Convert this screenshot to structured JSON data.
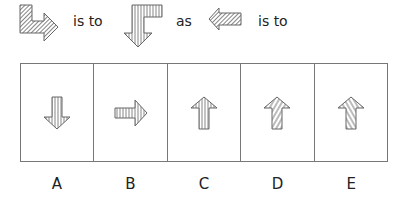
{
  "question": {
    "figure1": {
      "icon": "l-shaped-arrow-right-icon",
      "hatch": "diagonal-dense",
      "color": "#888888"
    },
    "text1": "is to",
    "figure2": {
      "icon": "l-shaped-arrow-down-icon",
      "hatch": "vertical"
    },
    "text2": "as",
    "figure3": {
      "icon": "arrow-left-icon",
      "hatch": "diagonal-dense"
    },
    "text3": "is to"
  },
  "options": [
    {
      "label": "A",
      "icon": "arrow-down-icon",
      "hatch": "vertical"
    },
    {
      "label": "B",
      "icon": "arrow-right-icon",
      "hatch": "vertical"
    },
    {
      "label": "C",
      "icon": "arrow-up-icon",
      "hatch": "vertical"
    },
    {
      "label": "D",
      "icon": "arrow-up-icon",
      "hatch": "diagonal-forward"
    },
    {
      "label": "E",
      "icon": "arrow-up-icon",
      "hatch": "diagonal-backward"
    }
  ],
  "colors": {
    "stroke": "#666666",
    "border": "#777777",
    "text": "#222222"
  }
}
